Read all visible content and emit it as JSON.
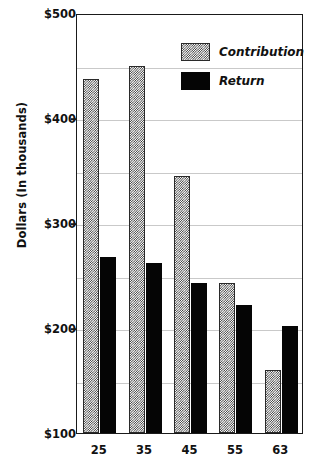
{
  "chart_data": {
    "type": "bar",
    "title": "",
    "xlabel": "",
    "ylabel": "Dollars (In thousands)",
    "categories": [
      "25",
      "35",
      "45",
      "55",
      "63"
    ],
    "series": [
      {
        "name": "Contribution",
        "values": [
          437,
          450,
          345,
          243,
          160
        ],
        "pattern": "checkerboard-hatch",
        "color": "#2b2b2b"
      },
      {
        "name": "Return",
        "values": [
          268,
          262,
          243,
          222,
          202
        ],
        "pattern": "solid",
        "color": "#050505"
      }
    ],
    "ylim": [
      100,
      500
    ],
    "y_ticks": [
      100,
      200,
      300,
      400,
      500
    ],
    "y_tick_labels": [
      "$100",
      "$200",
      "$300",
      "$400",
      "$500"
    ],
    "y_minor_gridlines": [
      150,
      200,
      250,
      300,
      350,
      400,
      450
    ],
    "grid": true,
    "legend_position": "top-right",
    "legend_entries": [
      "Contribution",
      "Return"
    ],
    "axis_color": "#1a1a1a",
    "gridline_color": "#c9c9c9",
    "background": "#ffffff"
  },
  "axes": {
    "y_title": "Dollars (In thousands)"
  },
  "legend": {
    "items": [
      {
        "label": "Contribution"
      },
      {
        "label": "Return"
      }
    ]
  }
}
